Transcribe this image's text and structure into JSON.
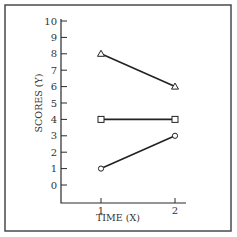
{
  "chart_data": {
    "type": "line",
    "title": "",
    "xlabel": "TIME (X)",
    "ylabel": "SCORES (Y)",
    "x": [
      1,
      2
    ],
    "x_tick_labels": [
      "1",
      "2"
    ],
    "y_tick_labels": [
      "0",
      "1",
      "2",
      "3",
      "4",
      "5",
      "6",
      "7",
      "8",
      "9",
      "10"
    ],
    "ylim": [
      0,
      10
    ],
    "grid": false,
    "legend": null,
    "series": [
      {
        "name": "triangle",
        "marker": "triangle",
        "values": [
          8,
          6
        ]
      },
      {
        "name": "square",
        "marker": "square",
        "values": [
          4,
          4
        ]
      },
      {
        "name": "circle",
        "marker": "circle",
        "values": [
          1,
          3
        ]
      }
    ]
  },
  "colors": {
    "line": "#222222",
    "frame": "#4a4a4a",
    "background": "#ffffff"
  }
}
